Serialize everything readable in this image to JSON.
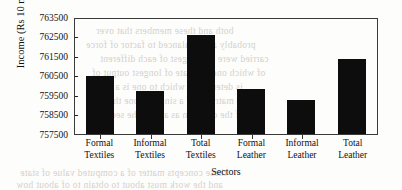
{
  "chart_data": {
    "type": "bar",
    "title": "",
    "subtitle": "",
    "xlabel": "Sectors",
    "ylabel": "Income (Rs 10 mn)",
    "categories": [
      "Formal Textiles",
      "Informal Textiles",
      "Total Textiles",
      "Formal Leather",
      "Informal Leather",
      "Total Leather"
    ],
    "category_lines": [
      [
        "Formal",
        "Textiles"
      ],
      [
        "Informal",
        "Textiles"
      ],
      [
        "Total",
        "Textiles"
      ],
      [
        "Formal",
        "Leather"
      ],
      [
        "Informal",
        "Leather"
      ],
      [
        "Total",
        "Leather"
      ]
    ],
    "values": [
      760450,
      759700,
      762580,
      759830,
      759250,
      761360
    ],
    "ylim": [
      757500,
      763500
    ],
    "yticks": [
      763500,
      762500,
      761500,
      760500,
      759500,
      758500,
      757500
    ],
    "ytick_labels": [
      "763500",
      "762500",
      "761500",
      "760500",
      "759500",
      "758500",
      "757500"
    ],
    "grid": false,
    "legend": null,
    "bar_color": "#0d0d0d",
    "axis_color": "#3a3a3a",
    "background_color": "#fdfdfc"
  },
  "background_text": {
    "note": "faint reversed bleed-through from reverse side of scanned page",
    "lines": [
      "both and these members that over",
      "probably a the balanced to factor of force",
      "carried were the longest of each different",
      "of which one estimate of longest output of",
      "is determined which to one is a of",
      "the matrix is of a single to one the con-",
      "of the common as a to of the second"
    ],
    "bottom_lines": [
      "these concepts matter of a computed value of state",
      "and the work must about to obtain to of about how"
    ]
  }
}
